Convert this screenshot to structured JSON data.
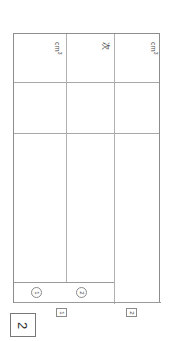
{
  "document": {
    "orientation": "rotated-90-clockwise",
    "type": "table-figure"
  },
  "figure": {
    "number_label": "2",
    "frame": {
      "columns": [
        {
          "id": "column-1",
          "unit_label": "cm",
          "unit_exponent": "3",
          "circle_marker": "1",
          "box_marker": "1"
        },
        {
          "id": "column-2",
          "unit_label": "次",
          "unit_exponent": "",
          "circle_marker": "2",
          "box_marker": ""
        },
        {
          "id": "column-3",
          "unit_label": "cm",
          "unit_exponent": "3",
          "circle_marker": "",
          "box_marker": "2"
        }
      ]
    }
  },
  "markers": {
    "circled": [
      "1",
      "2"
    ],
    "boxed": [
      "1",
      "2"
    ]
  }
}
